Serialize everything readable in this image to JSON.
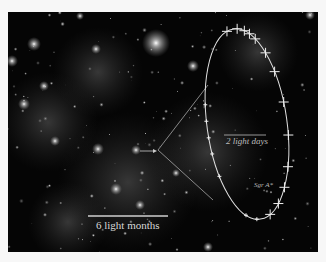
{
  "image": {
    "description": "Infrared star field of the Galactic Center with inset showing the orbit of a star around Sgr A*",
    "background_color": "#050505",
    "border_color": "#f7f7f7"
  },
  "labels": {
    "scale_large": "6 light months",
    "scale_small": "2 light days",
    "black_hole": "Sgr A*"
  },
  "orbit": {
    "shape": "ellipse",
    "data_points_count": 20,
    "point_style": "cross with error bars",
    "line_color": "#e0e0e0"
  },
  "arrow": {
    "target": "Sgr A* location in wide field"
  }
}
